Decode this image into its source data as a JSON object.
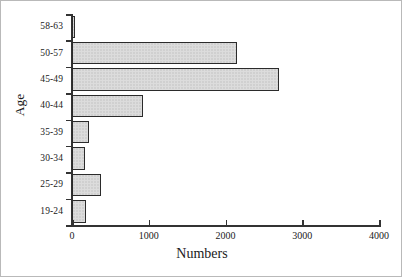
{
  "chart_data": {
    "type": "bar",
    "orientation": "horizontal",
    "title": "",
    "xlabel": "Numbers",
    "ylabel": "Age",
    "categories": [
      "58-63",
      "50-57",
      "45-49",
      "40-44",
      "35-39",
      "30-34",
      "25-29",
      "19-24"
    ],
    "values": [
      40,
      2150,
      2700,
      925,
      220,
      170,
      380,
      180
    ],
    "xlim": [
      0,
      4000
    ],
    "xticks": [
      0,
      1000,
      2000,
      3000,
      4000
    ],
    "xtick_labels": [
      "0",
      "1000",
      "2000",
      "3000",
      "4000"
    ],
    "grid": false,
    "legend": null,
    "bar_fill_color": "#dcdcdc",
    "bar_edge_color": "#2b2b2b",
    "axis_color": "#333333",
    "figure_border_color": "#b9b9b9",
    "background_color": "#ffffff"
  }
}
